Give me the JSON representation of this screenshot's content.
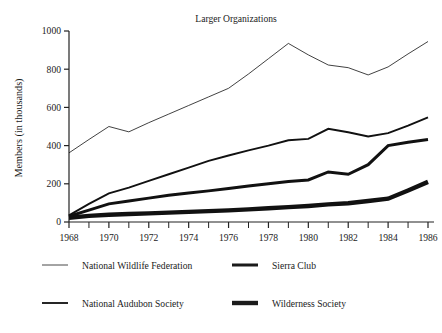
{
  "chart_data": {
    "type": "line",
    "title": "Larger Organizations",
    "xlabel": "",
    "ylabel": "Members (in thousands)",
    "xlim": [
      1968,
      1986
    ],
    "ylim": [
      0,
      1000
    ],
    "grid": false,
    "legend_position": "bottom",
    "x": [
      1968,
      1969,
      1970,
      1971,
      1972,
      1973,
      1974,
      1975,
      1976,
      1977,
      1978,
      1979,
      1980,
      1981,
      1982,
      1983,
      1984,
      1985,
      1986
    ],
    "xtick_labels": [
      "1968",
      "1970",
      "1972",
      "1974",
      "1976",
      "1978",
      "1980",
      "1982",
      "1984",
      "1986"
    ],
    "xtick_values": [
      1968,
      1970,
      1972,
      1974,
      1976,
      1978,
      1980,
      1982,
      1984,
      1986
    ],
    "xminor_tick_values": [
      1969,
      1971,
      1973,
      1975,
      1977,
      1979,
      1981,
      1983,
      1985
    ],
    "ytick_labels": [
      "0",
      "200",
      "400",
      "600",
      "800",
      "1000"
    ],
    "ytick_values": [
      0,
      200,
      400,
      600,
      800,
      1000
    ],
    "series": [
      {
        "name": "National Wildlife Federation",
        "stroke_width": 0.8,
        "values": [
          362,
          432,
          500,
          472,
          520,
          565,
          610,
          655,
          700,
          775,
          855,
          935,
          875,
          822,
          808,
          770,
          812,
          880,
          945
        ]
      },
      {
        "name": "National Audubon Society",
        "stroke_width": 1.9,
        "values": [
          35,
          95,
          150,
          180,
          215,
          250,
          285,
          320,
          348,
          375,
          400,
          428,
          435,
          488,
          470,
          448,
          465,
          505,
          548
        ]
      },
      {
        "name": "Sierra Club",
        "stroke_width": 3.0,
        "values": [
          30,
          62,
          95,
          110,
          125,
          140,
          152,
          163,
          175,
          188,
          200,
          212,
          220,
          262,
          250,
          300,
          400,
          418,
          432
        ]
      },
      {
        "name": "Wilderness Society",
        "stroke_width": 4.4,
        "values": [
          22,
          32,
          38,
          42,
          45,
          49,
          53,
          57,
          61,
          66,
          72,
          78,
          84,
          92,
          98,
          110,
          122,
          165,
          210
        ]
      }
    ]
  },
  "legend": {
    "entries": [
      {
        "label": "National Wildlife Federation",
        "stroke_width": 0.8
      },
      {
        "label": "Sierra Club",
        "stroke_width": 3.0
      },
      {
        "label": "National Audubon Society",
        "stroke_width": 1.9
      },
      {
        "label": "Wilderness Society",
        "stroke_width": 4.4
      }
    ]
  },
  "colors": {
    "ink": "#1b1b1b",
    "axis": "#222222",
    "background": "#ffffff"
  }
}
